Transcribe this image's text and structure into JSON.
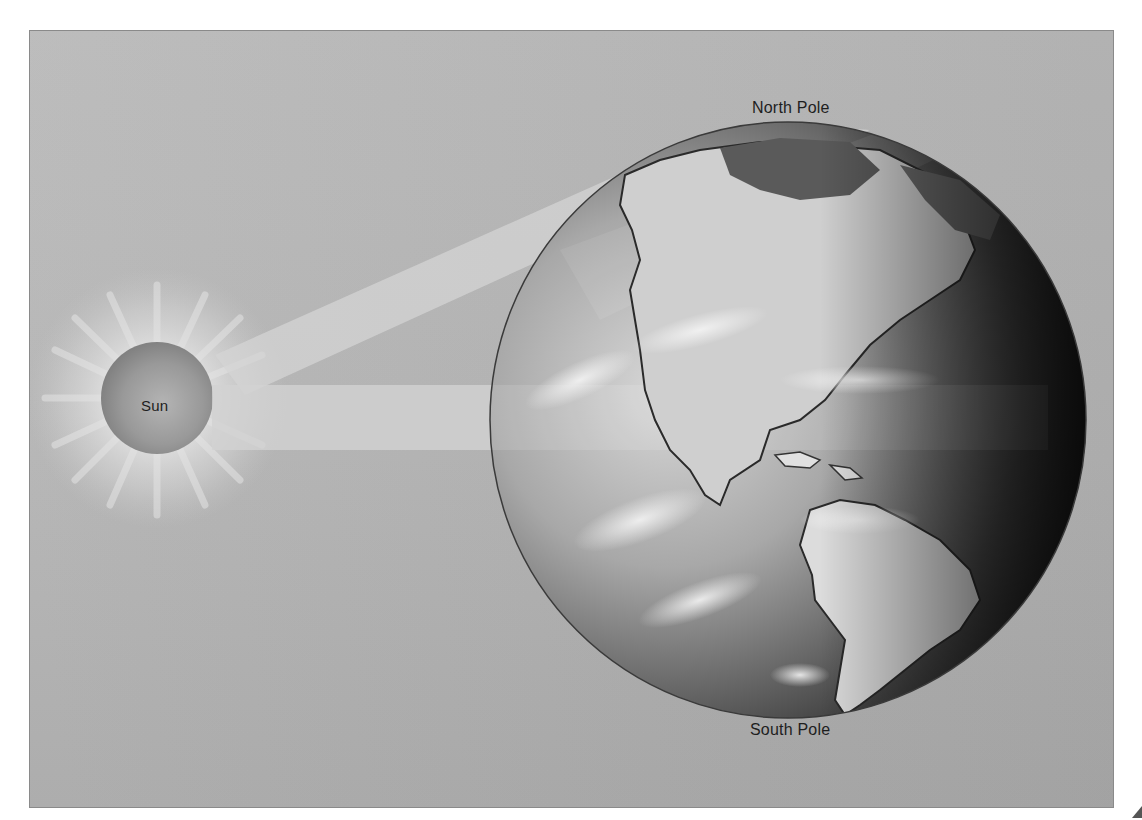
{
  "diagram": {
    "labels": {
      "sun": "Sun",
      "north_pole": "North Pole",
      "south_pole": "South Pole"
    },
    "elements": [
      {
        "name": "sun",
        "type": "glowing-sphere"
      },
      {
        "name": "earth-globe",
        "type": "sphere-with-continents",
        "visible_region": "Americas"
      },
      {
        "name": "sunlight-beam-oblique",
        "type": "light-beam",
        "target": "northern-latitudes"
      },
      {
        "name": "sunlight-beam-direct",
        "type": "light-beam",
        "target": "equator"
      }
    ],
    "colors": {
      "background": "#b5b5b5",
      "sun_core": "#8e8e8e",
      "beam": "#d2d2d2",
      "globe_dark": "#1a1a1a",
      "globe_light": "#e6e6e6",
      "text": "#1e1e1e"
    }
  }
}
